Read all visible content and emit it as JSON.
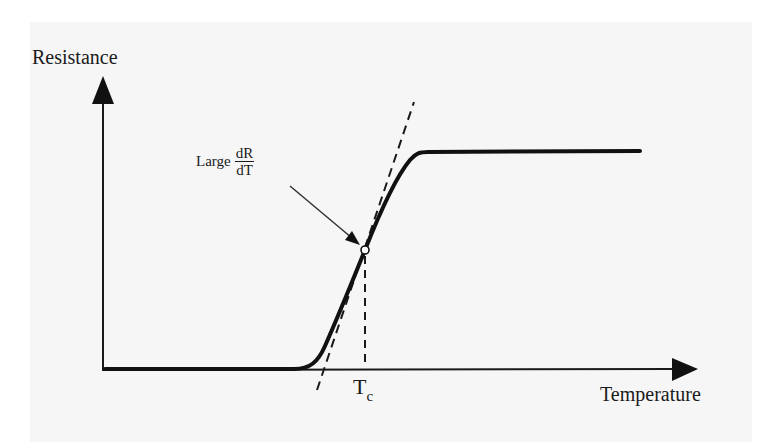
{
  "diagram": {
    "type": "resistance-vs-temperature",
    "y_axis": {
      "label": "Resistance"
    },
    "x_axis": {
      "label": "Temperature"
    },
    "annotation": {
      "prefix": "Large",
      "fraction_numerator": "dR",
      "fraction_denominator": "dT"
    },
    "critical_temperature": {
      "symbol": "T",
      "subscript": "c"
    },
    "curve": {
      "shape": "sigmoid step",
      "low_level": "near zero below transition",
      "high_level": "constant plateau above transition",
      "inflection_point_marked": true,
      "tangent_line_dashed": true,
      "vertical_dashed_to_Tc": true
    },
    "colors": {
      "line": "#1a1a1a",
      "background": "#f6f6f6"
    }
  }
}
